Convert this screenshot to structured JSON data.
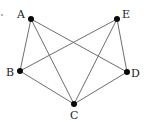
{
  "graph": {
    "nodes": [
      {
        "id": "A",
        "label": "A"
      },
      {
        "id": "B",
        "label": "B"
      },
      {
        "id": "C",
        "label": "C"
      },
      {
        "id": "D",
        "label": "D"
      },
      {
        "id": "E",
        "label": "E"
      }
    ],
    "edges": [
      [
        "A",
        "B"
      ],
      [
        "A",
        "C"
      ],
      [
        "A",
        "D"
      ],
      [
        "E",
        "B"
      ],
      [
        "E",
        "C"
      ],
      [
        "E",
        "D"
      ],
      [
        "B",
        "C"
      ],
      [
        "C",
        "D"
      ]
    ],
    "colors": {
      "edge": "#6e6e6e",
      "node": "#0a0a0a",
      "label": "#222222"
    }
  }
}
